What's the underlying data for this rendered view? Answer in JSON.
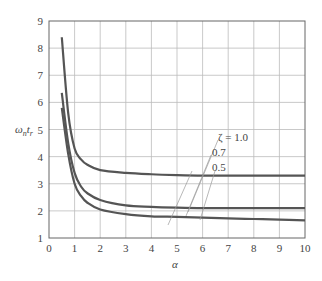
{
  "chart_data": {
    "type": "line",
    "title": "",
    "xlabel": "α",
    "ylabel": "ωₙtᵣ",
    "xlim": [
      0,
      10
    ],
    "ylim": [
      1,
      9
    ],
    "grid": true,
    "x_ticks": [
      "0",
      "1",
      "2",
      "3",
      "4",
      "5",
      "6",
      "7",
      "8",
      "9",
      "10"
    ],
    "y_ticks": [
      "1",
      "2",
      "3",
      "4",
      "5",
      "6",
      "7",
      "8",
      "9"
    ],
    "x": [
      0.5,
      0.75,
      1.0,
      1.25,
      1.5,
      2,
      3,
      4,
      5,
      6,
      7,
      8,
      9,
      10
    ],
    "series": [
      {
        "name": "ζ = 1.0",
        "values": [
          8.4,
          5.6,
          4.3,
          3.9,
          3.7,
          3.5,
          3.4,
          3.35,
          3.32,
          3.3,
          3.3,
          3.3,
          3.3,
          3.3
        ]
      },
      {
        "name": "0.7",
        "values": [
          6.35,
          4.5,
          3.4,
          2.9,
          2.65,
          2.4,
          2.2,
          2.15,
          2.12,
          2.1,
          2.1,
          2.1,
          2.1,
          2.1
        ]
      },
      {
        "name": "0.5",
        "values": [
          5.8,
          4.1,
          3.0,
          2.55,
          2.3,
          2.05,
          1.88,
          1.8,
          1.78,
          1.75,
          1.72,
          1.7,
          1.68,
          1.65
        ]
      }
    ],
    "annotations": [
      "ζ = 1.0",
      "0.7",
      "0.5"
    ]
  },
  "labels": {
    "ylabel_main": "ω",
    "ylabel_sub1": "n",
    "ylabel_t": "t",
    "ylabel_sub2": "r",
    "xlabel": "α",
    "ann_zeta": "ζ = 1.0",
    "ann_07": "0.7",
    "ann_05": "0.5"
  }
}
